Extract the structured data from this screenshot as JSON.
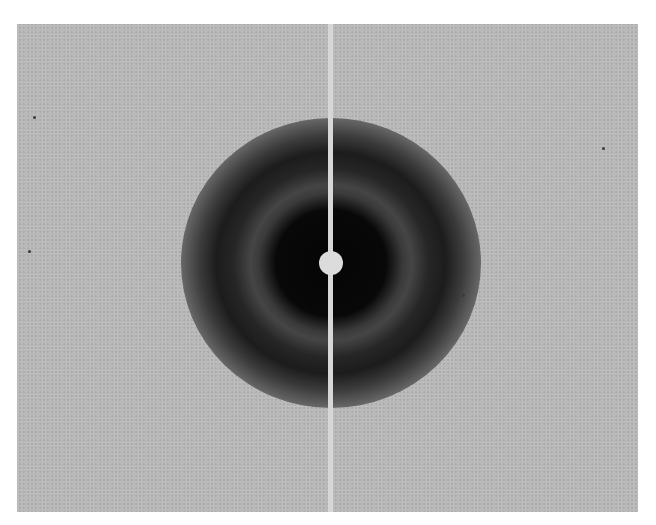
{
  "image": {
    "description": "X-ray diffraction pattern with diffuse concentric rings and a central beam stop",
    "plate": {
      "left": 17,
      "top": 24,
      "width": 621,
      "height": 488,
      "background": "#b9b9b9"
    },
    "center": {
      "x": 331,
      "y": 263
    },
    "beam_stop": {
      "disk_radius": 12,
      "wire_width": 5,
      "color": "#dcdcdc"
    },
    "rings": [
      {
        "name": "inner-dark-core",
        "radius": 42,
        "tone": "#080808"
      },
      {
        "name": "light-ring",
        "radius": 55,
        "tone": "#454545"
      },
      {
        "name": "outer-dark-ring",
        "radius": 78,
        "tone": "#1c1c1c"
      },
      {
        "name": "diffuse-halo",
        "radius": 140,
        "tone": "#969696"
      }
    ]
  }
}
